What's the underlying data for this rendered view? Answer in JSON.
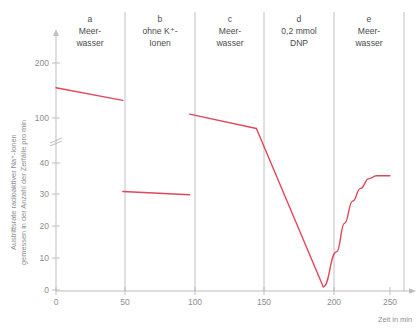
{
  "chart_data": {
    "type": "line",
    "title": "",
    "xlabel": "Zeit in min",
    "ylabel": "Austrittsrate radioaktiver Na⁺-Ionen gemessen in der Anzahl der Zerfälle pro min",
    "ylabel_line1": "Austrittsrate radioaktiver Na",
    "ylabel_line1_sup": "+",
    "ylabel_line1_end": "-Ionen",
    "ylabel_line2": "gemessen in der Anzahl der Zerfälle pro min",
    "xlim": [
      0,
      260
    ],
    "ylim": [
      0,
      230
    ],
    "grid": false,
    "legend": false,
    "axis_break": true,
    "axis_break_note": "y-axis broken between 40 and 100",
    "xticks": [
      0,
      50,
      100,
      150,
      200,
      250
    ],
    "xtick_labels": [
      "0",
      "50",
      "100",
      "150",
      "200",
      "250"
    ],
    "yticks": [
      0,
      10,
      20,
      30,
      40,
      100,
      200
    ],
    "ytick_labels": [
      "0",
      "10",
      "20",
      "30",
      "40",
      "100",
      "200"
    ],
    "line_color": "#e0485a",
    "panels": [
      {
        "letter": "a",
        "label_lines": [
          "Meer-",
          "wasser"
        ],
        "x_start": 0,
        "x_end": 50
      },
      {
        "letter": "b",
        "label_lines": [
          "ohne K⁺-",
          "Ionen"
        ],
        "x_start": 50,
        "x_end": 100
      },
      {
        "letter": "c",
        "label_lines": [
          "Meer-",
          "wasser"
        ],
        "x_start": 100,
        "x_end": 150
      },
      {
        "letter": "d",
        "label_lines": [
          "0,2 mmol",
          "DNP"
        ],
        "x_start": 150,
        "x_end": 200
      },
      {
        "letter": "e",
        "label_lines": [
          "Meer-",
          "wasser"
        ],
        "x_start": 200,
        "x_end": 250
      }
    ],
    "series": [
      {
        "name": "Austrittsrate radioaktiver Na+-Ionen",
        "color": "#e0485a",
        "segments": [
          {
            "panel": "a",
            "points": [
              [
                0,
                155
              ],
              [
                50,
                132
              ]
            ]
          },
          {
            "panel": "b",
            "points": [
              [
                50,
                31
              ],
              [
                100,
                30
              ]
            ]
          },
          {
            "panel": "c",
            "points": [
              [
                100,
                107
              ],
              [
                150,
                81
              ]
            ]
          },
          {
            "panel": "d",
            "points": [
              [
                150,
                81
              ],
              [
                200,
                1
              ]
            ]
          },
          {
            "panel": "e",
            "points": [
              [
                200,
                1
              ],
              [
                210,
                12
              ],
              [
                216,
                21
              ],
              [
                222,
                28
              ],
              [
                228,
                32
              ],
              [
                234,
                35
              ],
              [
                240,
                36
              ],
              [
                250,
                36
              ]
            ]
          }
        ]
      }
    ]
  }
}
